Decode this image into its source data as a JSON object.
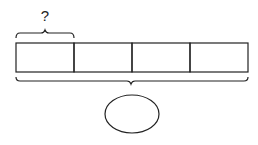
{
  "diagram": {
    "type": "tape-diagram",
    "segments": 4,
    "top_label": "?",
    "top_brace_spans_segments": 1,
    "bottom_brace_spans_segments": 4,
    "bottom_oval_label": "",
    "colors": {
      "stroke": "#222222",
      "background": "#ffffff"
    }
  }
}
